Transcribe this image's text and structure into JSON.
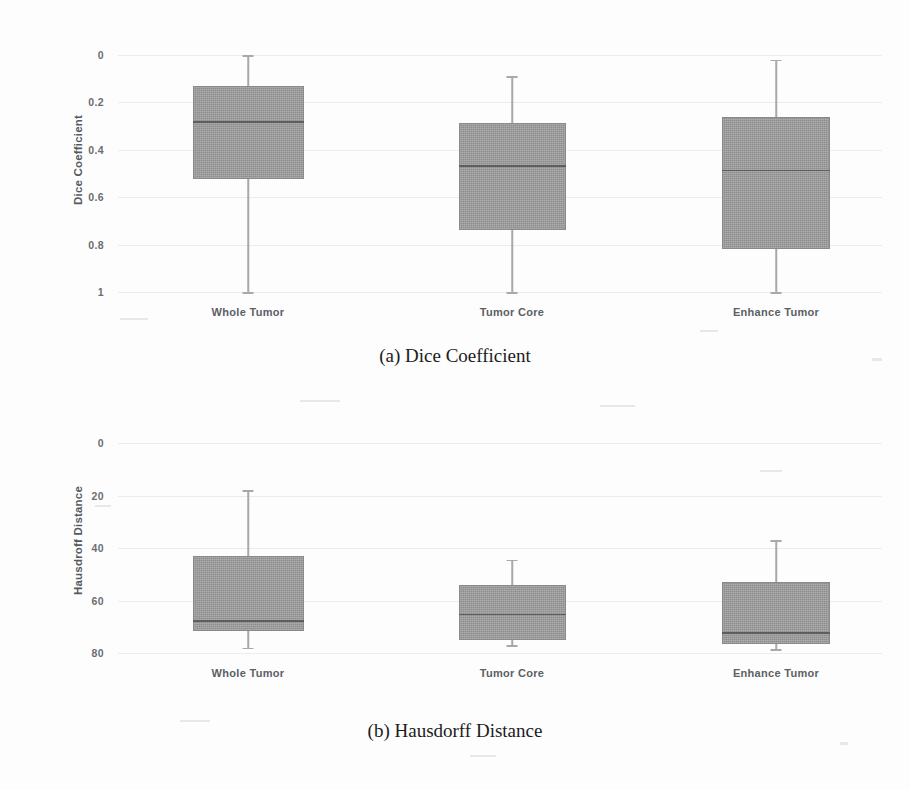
{
  "figure": {
    "background_color": "#fdfdfd",
    "box_fill_color": "#9b9b9b",
    "box_edge_color": "#8a8a8a",
    "median_color": "#5e5e5e",
    "whisker_color": "#a8a8a8",
    "gridline_color": "#ececec"
  },
  "panel_a": {
    "caption": "(a) Dice Coefficient",
    "ylabel": "Dice Coefficient",
    "yticks": [
      "1",
      "0.8",
      "0.6",
      "0.4",
      "0.2",
      "0"
    ],
    "categories": [
      "Whole Tumor",
      "Tumor Core",
      "Enhance Tumor"
    ]
  },
  "panel_b": {
    "caption": "(b) Hausdorff Distance",
    "ylabel": "Hausdroff Distance",
    "yticks": [
      "80",
      "60",
      "40",
      "20",
      "0"
    ],
    "categories": [
      "Whole Tumor",
      "Tumor Core",
      "Enhance Tumor"
    ]
  },
  "chart_data": [
    {
      "type": "box",
      "id": "dice-coefficient",
      "title": "(a) Dice Coefficient",
      "xlabel": "",
      "ylabel": "Dice Coefficient",
      "ylim": [
        0,
        1
      ],
      "yticks": [
        0,
        0.2,
        0.4,
        0.6,
        0.8,
        1
      ],
      "grid": true,
      "legend": "none",
      "categories": [
        "Whole Tumor",
        "Tumor Core",
        "Enhance Tumor"
      ],
      "boxes": [
        {
          "category": "Whole Tumor",
          "whisker_low": 0.0,
          "q1": 0.475,
          "median": 0.72,
          "q3": 0.87,
          "whisker_high": 1.0
        },
        {
          "category": "Tumor Core",
          "whisker_low": 0.0,
          "q1": 0.26,
          "median": 0.535,
          "q3": 0.715,
          "whisker_high": 0.91
        },
        {
          "category": "Enhance Tumor",
          "whisker_low": 0.0,
          "q1": 0.18,
          "median": 0.515,
          "q3": 0.74,
          "whisker_high": 0.98
        }
      ]
    },
    {
      "type": "box",
      "id": "hausdorff-distance",
      "title": "(b) Hausdorff Distance",
      "xlabel": "",
      "ylabel": "Hausdroff Distance",
      "ylim": [
        0,
        80
      ],
      "yticks": [
        0,
        20,
        40,
        60,
        80
      ],
      "grid": true,
      "legend": "none",
      "categories": [
        "Whole Tumor",
        "Tumor Core",
        "Enhance Tumor"
      ],
      "boxes": [
        {
          "category": "Whole Tumor",
          "whisker_low": 2.0,
          "q1": 8.5,
          "median": 12.5,
          "q3": 37.0,
          "whisker_high": 62.0
        },
        {
          "category": "Tumor Core",
          "whisker_low": 3.0,
          "q1": 5.0,
          "median": 15.0,
          "q3": 26.0,
          "whisker_high": 35.5
        },
        {
          "category": "Enhance Tumor",
          "whisker_low": 1.5,
          "q1": 3.5,
          "median": 8.0,
          "q3": 27.0,
          "whisker_high": 43.0
        }
      ]
    }
  ]
}
